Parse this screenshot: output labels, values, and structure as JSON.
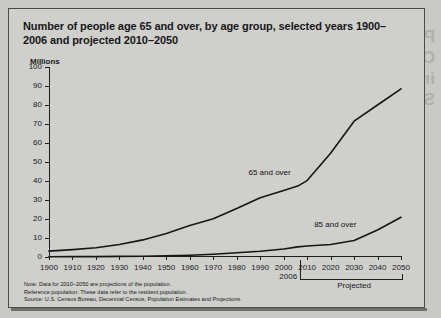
{
  "figure": {
    "title": "Number of people age 65 and over, by age group, selected years 1900–2006 and projected 2010–2050",
    "y_axis_unit": "Millions",
    "marker_2006": "2006",
    "projected_label": "Projected",
    "notes": {
      "note": "Note: Data for 2010–2050 are projections of the population.",
      "reference": "Reference population: These data refer to the resident population.",
      "source": "Source: U.S. Census Bureau, Decennial Census, Population Estimates and Projections."
    }
  },
  "bleed_through_text": "Prevention of\nCardiovascular Disease\nin Older Adults: A\nStatus Report",
  "chart_data": {
    "type": "line",
    "title": "Number of people age 65 and over, by age group, selected years 1900–2006 and projected 2010–2050",
    "xlabel": "",
    "ylabel": "Millions",
    "xlim": [
      1900,
      2050
    ],
    "ylim": [
      0,
      100
    ],
    "grid": false,
    "legend": "inline-annotations",
    "x": [
      1900,
      1910,
      1920,
      1930,
      1940,
      1950,
      1960,
      1970,
      1980,
      1990,
      2000,
      2006,
      2010,
      2020,
      2030,
      2040,
      2050
    ],
    "xticks": [
      1900,
      1910,
      1920,
      1930,
      1940,
      1950,
      1960,
      1970,
      1980,
      1990,
      2000,
      2010,
      2020,
      2030,
      2040,
      2050
    ],
    "yticks": [
      0,
      10,
      20,
      30,
      40,
      50,
      60,
      70,
      80,
      90,
      100
    ],
    "series": [
      {
        "name": "65 and over",
        "values": [
          3.1,
          3.9,
          4.9,
          6.6,
          9.0,
          12.3,
          16.6,
          20.1,
          25.5,
          31.2,
          35.0,
          37.3,
          40.2,
          54.6,
          71.5,
          80.0,
          88.5
        ]
      },
      {
        "name": "85 and over",
        "values": [
          0.1,
          0.2,
          0.2,
          0.3,
          0.4,
          0.6,
          0.9,
          1.4,
          2.2,
          3.0,
          4.2,
          5.3,
          5.8,
          6.6,
          8.7,
          14.2,
          20.9
        ]
      }
    ],
    "annotations": [
      {
        "text": "65 and over",
        "x": 1985,
        "y": 44
      },
      {
        "text": "85 and over",
        "x": 2013,
        "y": 17
      },
      {
        "text": "2006",
        "x": 2006,
        "y": -8
      },
      {
        "text": "Projected",
        "x": 2030,
        "y": -16
      }
    ]
  }
}
